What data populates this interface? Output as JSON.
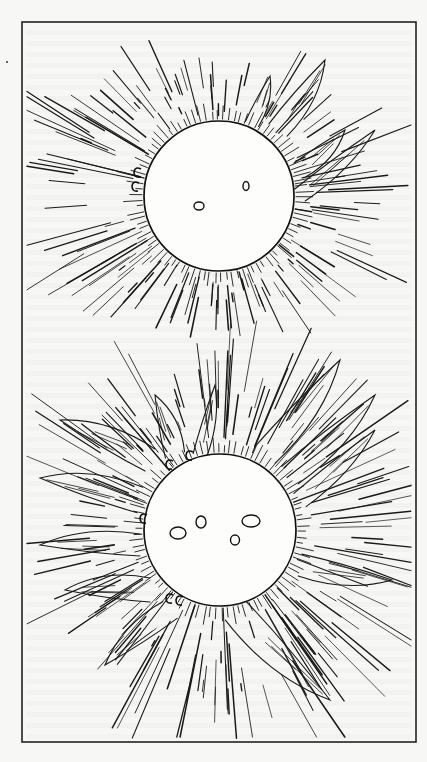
{
  "figure": {
    "canvas": {
      "width": 427,
      "height": 762,
      "background": "#f7f7f5"
    },
    "frame": {
      "x": 22,
      "y": 22,
      "width": 394,
      "height": 720,
      "color": "#222222"
    },
    "page_marker": {
      "x": 7,
      "y": 62
    },
    "panels": [
      {
        "name": "upper-sun",
        "center": [
          219,
          196
        ],
        "radius": 75,
        "ray_seed": 7,
        "ray_count": 150,
        "ray_extent": {
          "left": 2.0,
          "right": 1.5,
          "top": 0.9,
          "bottom": 0.7
        },
        "sunspots": [
          {
            "cx": 199,
            "cy": 206,
            "rx": 5,
            "ry": 4
          },
          {
            "cx": 246,
            "cy": 186,
            "rx": 3,
            "ry": 4.5
          }
        ],
        "loops": [
          {
            "x": 136,
            "y": 172
          },
          {
            "x": 134,
            "y": 186
          }
        ],
        "prominences": [
          {
            "tip": [
              325,
              60
            ],
            "base": [
              278,
              130
            ],
            "width": 22
          },
          {
            "tip": [
              270,
              76
            ],
            "base": [
              252,
              124
            ],
            "width": 14
          },
          {
            "tip": [
              345,
              130
            ],
            "base": [
              300,
              170
            ],
            "width": 18
          },
          {
            "tip": [
              375,
              130
            ],
            "base": [
              300,
              195
            ],
            "width": 16
          }
        ]
      },
      {
        "name": "lower-sun",
        "center": [
          220,
          530
        ],
        "radius": 76,
        "ray_seed": 19,
        "ray_count": 190,
        "ray_extent": {
          "left": 1.7,
          "right": 1.8,
          "top": 1.8,
          "bottom": 2.2
        },
        "sunspots": [
          {
            "cx": 178,
            "cy": 533,
            "rx": 8,
            "ry": 6
          },
          {
            "cx": 201,
            "cy": 522,
            "rx": 5,
            "ry": 6
          },
          {
            "cx": 251,
            "cy": 521,
            "rx": 9,
            "ry": 6
          },
          {
            "cx": 235,
            "cy": 540,
            "rx": 4.5,
            "ry": 5
          }
        ],
        "loops": [
          {
            "x": 168,
            "y": 464
          },
          {
            "x": 188,
            "y": 455
          },
          {
            "x": 142,
            "y": 518
          },
          {
            "x": 168,
            "y": 598
          },
          {
            "x": 178,
            "y": 600
          }
        ],
        "prominences": [
          {
            "tip": [
              60,
              420
            ],
            "base": [
              150,
              460
            ],
            "width": 24
          },
          {
            "tip": [
              40,
              478
            ],
            "base": [
              140,
              500
            ],
            "width": 26
          },
          {
            "tip": [
              40,
              545
            ],
            "base": [
              140,
              545
            ],
            "width": 22
          },
          {
            "tip": [
              65,
              590
            ],
            "base": [
              150,
              590
            ],
            "width": 24
          },
          {
            "tip": [
              105,
              665
            ],
            "base": [
              170,
              610
            ],
            "width": 22
          },
          {
            "tip": [
              340,
              360
            ],
            "base": [
              265,
              455
            ],
            "width": 26
          },
          {
            "tip": [
              375,
              395
            ],
            "base": [
              290,
              475
            ],
            "width": 24
          },
          {
            "tip": [
              375,
              430
            ],
            "base": [
              300,
              500
            ],
            "width": 18
          },
          {
            "tip": [
              392,
              580
            ],
            "base": [
              300,
              565
            ],
            "width": 22
          },
          {
            "tip": [
              330,
              700
            ],
            "base": [
              235,
              610
            ],
            "width": 28
          },
          {
            "tip": [
              215,
              385
            ],
            "base": [
              200,
              455
            ],
            "width": 14
          },
          {
            "tip": [
              155,
              395
            ],
            "base": [
              175,
              455
            ],
            "width": 20
          }
        ]
      }
    ]
  }
}
